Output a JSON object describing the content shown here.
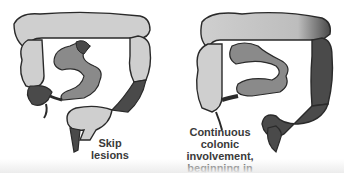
{
  "diagram": {
    "type": "anatomical-comparison",
    "colors": {
      "healthy_colon": "#cfcfcf",
      "small_intestine": "#8a8a8a",
      "diseased_segment": "#4a4a4a",
      "outline": "#2a2a2a",
      "text": "#3a3a3a"
    },
    "panels": [
      {
        "id": "left",
        "caption_lines": [
          "Skip",
          "lesions"
        ]
      },
      {
        "id": "right",
        "caption_lines": [
          "Continuous",
          "colonic involvement,",
          "beginning in rectum"
        ]
      }
    ]
  }
}
